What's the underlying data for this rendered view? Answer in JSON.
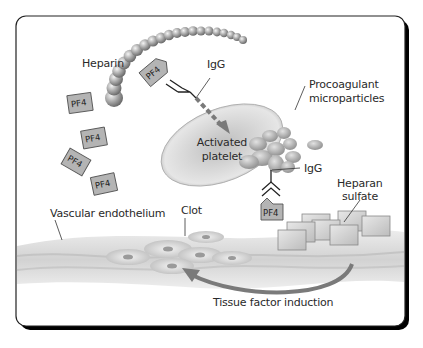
{
  "figure": {
    "labels": {
      "heparin": "Heparin",
      "igg_top": "IgG",
      "activated_platelet_line1": "Activated",
      "activated_platelet_line2": "platelet",
      "procoagulant_line1": "Procoagulant",
      "procoagulant_line2": "microparticles",
      "igg_right": "IgG",
      "heparan_line1": "Heparan",
      "heparan_line2": "sulfate",
      "vascular_endothelium": "Vascular endothelium",
      "clot": "Clot",
      "tissue_factor": "Tissue factor induction"
    },
    "pf4_label": "PF4",
    "free_pf4_count": 4,
    "colors": {
      "frame": "#000000",
      "heparin_bead": "#9a9a9a",
      "platelet": "#c8c8c8",
      "pf4_box": "#b4b4b4",
      "arrow": "#7a7a7a",
      "endothelium": "#d6d6d6"
    }
  }
}
